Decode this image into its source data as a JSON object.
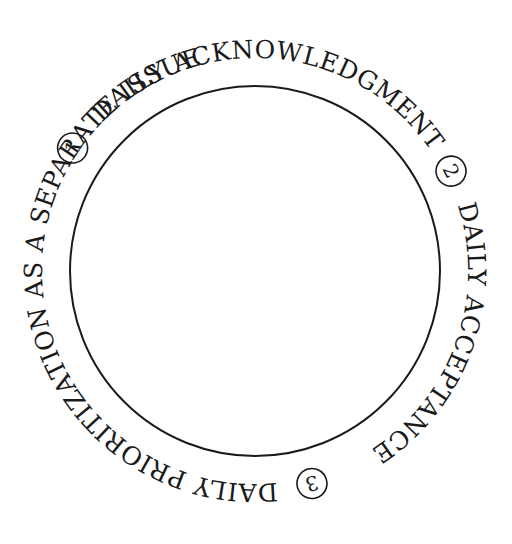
{
  "diagram": {
    "center": [
      255,
      271
    ],
    "inner_circle_radius": 185,
    "text_radius": 213,
    "stroke_color": "#1a1a1a",
    "background": "#ffffff",
    "labels": [
      {
        "number": "1",
        "text": "DAILY ACKNOWLEDGMENT",
        "marker_angle": -62
      },
      {
        "number": "2",
        "text": "DAILY ACCEPTANCE",
        "marker_angle": 62
      },
      {
        "number": "3",
        "text": "DAILY PRIORITIZATION AS A SEPARATE ISSUE",
        "marker_angle": 164
      }
    ],
    "text_segments": {
      "seg1": "DAILY ACKNOWLEDGMENT",
      "seg2": "DAILY ACCEPTANCE",
      "seg3": "DAILY PRIORITIZATION AS A SEPARATE ISSUE"
    },
    "numbers": {
      "n1": "1",
      "n2": "2",
      "n3": "3"
    }
  }
}
